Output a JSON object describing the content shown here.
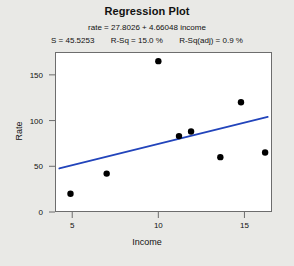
{
  "chart_data": {
    "type": "scatter",
    "title": "Regression Plot",
    "equation": "rate = 27.8026 + 4.66048 income",
    "stats": [
      "S = 45.5253",
      "R-Sq = 15.0 %",
      "R-Sq(adj) = 0.9 %"
    ],
    "xlabel": "Income",
    "ylabel": "Rate",
    "xlim": [
      4.0,
      16.6
    ],
    "ylim": [
      0,
      175
    ],
    "xticks": [
      5,
      10,
      15
    ],
    "yticks": [
      0,
      50,
      100,
      150
    ],
    "grid": false,
    "legend": null,
    "point_color": "#000000",
    "line_color": "#2244bb",
    "axis_color": "#6d6d6d",
    "background": "#ffffff",
    "page_background": "#e9e9e6",
    "points": [
      {
        "x": 4.9,
        "y": 20
      },
      {
        "x": 7.0,
        "y": 42
      },
      {
        "x": 10.0,
        "y": 165
      },
      {
        "x": 11.2,
        "y": 83
      },
      {
        "x": 11.9,
        "y": 88
      },
      {
        "x": 13.6,
        "y": 60
      },
      {
        "x": 14.8,
        "y": 120
      },
      {
        "x": 16.2,
        "y": 65
      }
    ],
    "fit_line": {
      "intercept": 27.8026,
      "slope": 4.66048,
      "x_start": 4.25,
      "x_end": 16.35
    }
  }
}
